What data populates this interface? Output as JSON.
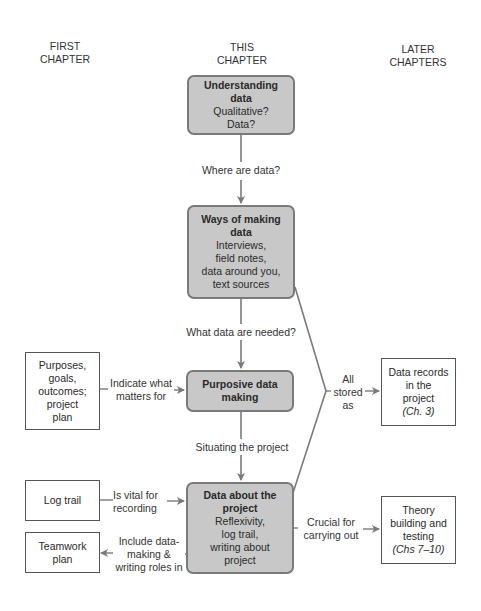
{
  "headers": {
    "first": [
      "FIRST",
      "CHAPTER"
    ],
    "this": [
      "THIS",
      "CHAPTER"
    ],
    "later": [
      "LATER",
      "CHAPTERS"
    ]
  },
  "center_boxes": [
    {
      "title": [
        "Understanding",
        "data"
      ],
      "lines": [
        "Qualitative?",
        "Data?"
      ]
    },
    {
      "title": [
        "Ways of making",
        "data"
      ],
      "lines": [
        "Interviews,",
        "field notes,",
        "data around you,",
        "text sources"
      ]
    },
    {
      "title": [
        "Purposive data",
        "making"
      ],
      "lines": []
    },
    {
      "title": [
        "Data about the",
        "project"
      ],
      "lines": [
        "Reflexivity,",
        "log trail,",
        "writing about",
        "project"
      ]
    }
  ],
  "center_labels": [
    "Where are data?",
    "What data are needed?",
    "Situating the project"
  ],
  "left_boxes": [
    {
      "lines": [
        "Purposes,",
        "goals,",
        "outcomes;",
        "project",
        "plan"
      ]
    },
    {
      "lines": [
        "Log trail"
      ]
    },
    {
      "lines": [
        "Teamwork",
        "plan"
      ]
    }
  ],
  "left_labels": [
    [
      "Indicate what",
      "matters for"
    ],
    [
      "Is vital for",
      "recording"
    ],
    [
      "Include data-",
      "making &",
      "writing roles in"
    ]
  ],
  "right_boxes": [
    {
      "lines": [
        "Data records",
        "in the",
        "project"
      ],
      "italic": "(Ch. 3)"
    },
    {
      "lines": [
        "Theory",
        "building and",
        "testing"
      ],
      "italic": "(Chs 7–10)"
    }
  ],
  "right_labels": [
    [
      "All",
      "stored",
      "as"
    ],
    [
      "Crucial for",
      "carrying out"
    ]
  ],
  "colors": {
    "box_fill": "#c8c8c8",
    "box_border": "#7a7a7a",
    "line": "#7a7a7a"
  }
}
